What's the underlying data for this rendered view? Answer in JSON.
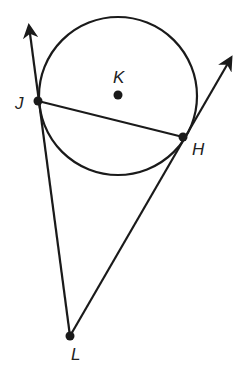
{
  "diagram": {
    "type": "geometry",
    "colors": {
      "stroke": "#1a1a1a",
      "background": "#ffffff"
    },
    "circle": {
      "name": "K",
      "center": [
        118,
        96
      ],
      "radius": 79
    },
    "points": {
      "J": {
        "label": "J",
        "x": 38,
        "y": 101
      },
      "H": {
        "label": "H",
        "x": 183,
        "y": 137
      },
      "K": {
        "label": "K",
        "x": 118,
        "y": 95
      },
      "L": {
        "label": "L",
        "x": 70,
        "y": 336
      }
    },
    "segments": [
      {
        "name": "chord-JH",
        "from": "J",
        "to": "H"
      }
    ],
    "rays": [
      {
        "name": "ray-LJ",
        "from": "L",
        "through": "J",
        "tip": [
          28,
          23
        ]
      },
      {
        "name": "ray-LH",
        "from": "L",
        "through": "H",
        "tip": [
          233,
          55
        ]
      }
    ]
  }
}
